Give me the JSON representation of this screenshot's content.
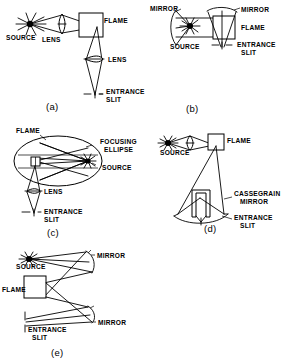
{
  "figure": {
    "width": 288,
    "height": 361,
    "line_color": "#000000",
    "background_color": "#ffffff"
  },
  "panels": [
    {
      "id": "a",
      "letter": "(a)",
      "description": "Single-pass lens system: source imaged through lens into flame, then second lens onto entrance slit",
      "labels": [
        {
          "name": "source-label-a",
          "text": "SOURCE",
          "x": 6,
          "y": 40
        },
        {
          "name": "lens-label-a",
          "text": "LENS",
          "x": 42,
          "y": 42
        },
        {
          "name": "flame-label-a",
          "text": "FLAME",
          "x": 104,
          "y": 23
        },
        {
          "name": "lens2-label-a",
          "text": "LENS",
          "x": 105,
          "y": 65
        },
        {
          "name": "entrance-slit-label-a",
          "text": "ENTRANCE",
          "x": 105,
          "y": 96
        },
        {
          "name": "entrance-slit-label-a2",
          "text": "SLIT",
          "x": 105,
          "y": 104
        }
      ]
    },
    {
      "id": "b",
      "letter": "(b)",
      "description": "Mirror system: concave mirrors redirect source radiation through flame to entrance slit",
      "labels": [
        {
          "name": "mirror-label-b1",
          "text": "MIRROR",
          "x": 152,
          "y": 10
        },
        {
          "name": "mirror-label-b2",
          "text": "MIRROR",
          "x": 238,
          "y": 12
        },
        {
          "name": "flame-label-b",
          "text": "FLAME",
          "x": 238,
          "y": 29
        },
        {
          "name": "source-label-b",
          "text": "SOURCE",
          "x": 170,
          "y": 46
        },
        {
          "name": "entrance-slit-label-b",
          "text": "ENTRANCE",
          "x": 234,
          "y": 46
        },
        {
          "name": "entrance-slit-label-b2",
          "text": "SLIT",
          "x": 238,
          "y": 54
        }
      ]
    },
    {
      "id": "c",
      "letter": "(c)",
      "description": "Focusing ellipse: source at one focus, flame at other focus of ellipsoidal reflector",
      "labels": [
        {
          "name": "flame-label-c",
          "text": "FLAME",
          "x": 18,
          "y": 132
        },
        {
          "name": "focusing-ellipse-label-c",
          "text": "FOCUSING",
          "x": 94,
          "y": 141
        },
        {
          "name": "focusing-ellipse-label-c2",
          "text": "ELLIPSE",
          "x": 94,
          "y": 149
        },
        {
          "name": "source-label-c",
          "text": "SOURCE",
          "x": 98,
          "y": 168
        },
        {
          "name": "lens-label-c",
          "text": "LENS",
          "x": 40,
          "y": 194
        },
        {
          "name": "entrance-slit-label-c",
          "text": "ENTRANCE",
          "x": 42,
          "y": 214
        },
        {
          "name": "entrance-slit-label-c2",
          "text": "SLIT",
          "x": 42,
          "y": 222
        }
      ]
    },
    {
      "id": "d",
      "letter": "(d)",
      "description": "Cassegrain mirror collects flame emission and focuses it on the entrance slit",
      "labels": [
        {
          "name": "source-label-d",
          "text": "SOURCE",
          "x": 163,
          "y": 155
        },
        {
          "name": "flame-label-d",
          "text": "FLAME",
          "x": 225,
          "y": 141
        },
        {
          "name": "cassegrain-mirror-label-d",
          "text": "CASSEGRAIN",
          "x": 233,
          "y": 195
        },
        {
          "name": "cassegrain-mirror-label-d2",
          "text": "MIRROR",
          "x": 237,
          "y": 203
        },
        {
          "name": "entrance-slit-label-d",
          "text": "ENTRANCE",
          "x": 233,
          "y": 219
        },
        {
          "name": "entrance-slit-label-d2",
          "text": "SLIT",
          "x": 237,
          "y": 227
        }
      ]
    },
    {
      "id": "e",
      "letter": "(e)",
      "description": "Double mirror folded beam: source to upper mirror through flame to lower mirror onto entrance slit",
      "labels": [
        {
          "name": "source-label-e",
          "text": "SOURCE",
          "x": 17,
          "y": 267
        },
        {
          "name": "mirror-label-e1",
          "text": "MIRROR",
          "x": 93,
          "y": 257
        },
        {
          "name": "flame-label-e",
          "text": "FLAME",
          "x": 4,
          "y": 289
        },
        {
          "name": "mirror-label-e2",
          "text": "MIRROR",
          "x": 96,
          "y": 325
        },
        {
          "name": "entrance-slit-label-e",
          "text": "ENTRANCE",
          "x": 26,
          "y": 331
        },
        {
          "name": "entrance-slit-label-e2",
          "text": "SLIT",
          "x": 30,
          "y": 339
        }
      ]
    }
  ],
  "panel_letters": [
    {
      "name": "panel-letter-a",
      "text": "(a)",
      "x": 46,
      "y": 108
    },
    {
      "name": "panel-letter-b",
      "text": "(b)",
      "x": 186,
      "y": 110
    },
    {
      "name": "panel-letter-c",
      "text": "(c)",
      "x": 47,
      "y": 234
    },
    {
      "name": "panel-letter-d",
      "text": "(d)",
      "x": 206,
      "y": 230
    },
    {
      "name": "panel-letter-e",
      "text": "(e)",
      "x": 51,
      "y": 354
    }
  ]
}
